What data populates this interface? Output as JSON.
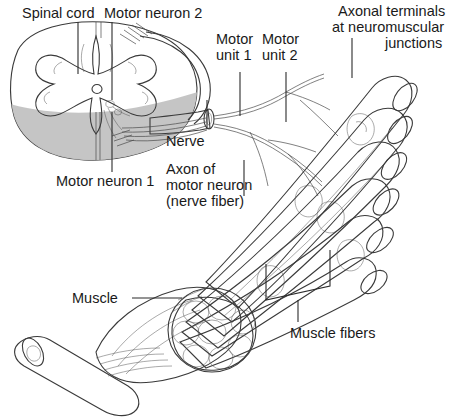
{
  "figure": {
    "background_color": "#ffffff",
    "width": 465,
    "height": 417
  },
  "labels": {
    "spinal_cord": "Spinal cord",
    "motor_neuron_2": "Motor neuron 2",
    "motor_neuron_1": "Motor neuron 1",
    "axonal_terminals_l1": "Axonal terminals",
    "axonal_terminals_l2": "at neuromuscular",
    "axonal_terminals_l3": "junctions",
    "motor_unit_1_l1": "Motor",
    "motor_unit_1_l2": "unit 1",
    "motor_unit_2_l1": "Motor",
    "motor_unit_2_l2": "unit 2",
    "nerve": "Nerve",
    "axon_l1": "Axon of",
    "axon_l2": "motor neuron",
    "axon_l3": "(nerve fiber)",
    "muscle": "Muscle",
    "muscle_fibers": "Muscle fibers"
  },
  "colors": {
    "white_matter": "#e9e9e9",
    "gray_matter": "#f2f2f2",
    "cord_shadow": "#c2c2c2",
    "muscle_fiber": "#9d9d9d",
    "muscle_fiber_dark": "#7e7e7e",
    "fiber_end": "#8a8a8a",
    "tendon": "#e4e4e4",
    "fascicle": "#8f8f8f",
    "outline": "#3a3a3a",
    "text": "#1a1a1a"
  },
  "structures": {
    "spinal_cord_section": "spinal-cord-cross-section",
    "nerve_trunk": "peripheral-nerve-trunk",
    "muscle_belly": "skeletal-muscle-belly",
    "tendon": "cut-tendon",
    "fiber_count": 6,
    "fascicle_count": 8
  }
}
